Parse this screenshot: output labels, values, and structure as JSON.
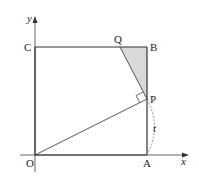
{
  "diagram": {
    "type": "geometry",
    "axes": {
      "x_label": "x",
      "y_label": "y",
      "origin_label": "O"
    },
    "points": {
      "O": {
        "label": "O",
        "x": 35,
        "y": 155
      },
      "A": {
        "label": "A",
        "x": 147,
        "y": 155
      },
      "B": {
        "label": "B",
        "x": 147,
        "y": 47
      },
      "C": {
        "label": "C",
        "x": 35,
        "y": 47
      },
      "P": {
        "label": "P",
        "x": 147,
        "y": 99
      },
      "Q": {
        "label": "Q",
        "x": 120,
        "y": 47
      }
    },
    "segments": [
      "OA",
      "AB",
      "BC",
      "CO",
      "OP",
      "PQ"
    ],
    "shaded_region": "triangle QBP",
    "right_angle_at": "P",
    "arc": {
      "from": "A",
      "to": "P",
      "label": "t",
      "style": "dashed"
    },
    "colors": {
      "line": "#333333",
      "shade": "#d9d9d9",
      "axis": "#555555"
    }
  }
}
